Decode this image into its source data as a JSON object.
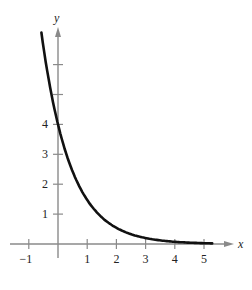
{
  "chart_data": {
    "type": "line",
    "title": "",
    "xlabel": "x",
    "ylabel": "y",
    "xlim": [
      -1.2,
      5.6
    ],
    "ylim": [
      -0.3,
      6.9
    ],
    "x_ticks": [
      -1,
      1,
      2,
      3,
      4,
      5
    ],
    "x_tick_labels": [
      "−1",
      "1",
      "2",
      "3",
      "4",
      "5"
    ],
    "y_ticks": [
      1,
      2,
      3,
      4,
      5,
      6
    ],
    "y_tick_labels": [
      "1",
      "2",
      "3",
      "4",
      "",
      ""
    ],
    "grid": false,
    "legend": null,
    "series": [
      {
        "name": "f(x) = 4e^(-x)",
        "function": "4*exp(-x)",
        "x": [
          -0.55,
          -0.25,
          0,
          0.5,
          1,
          1.5,
          2,
          2.5,
          3,
          3.5,
          4,
          4.5,
          5,
          5.3
        ],
        "y": [
          6.93,
          5.14,
          4.0,
          2.43,
          1.47,
          0.89,
          0.54,
          0.33,
          0.2,
          0.12,
          0.07,
          0.04,
          0.03,
          0.02
        ]
      }
    ]
  },
  "colors": {
    "axis": "#8a8a8a",
    "curve": "#111111",
    "text": "#222222"
  }
}
